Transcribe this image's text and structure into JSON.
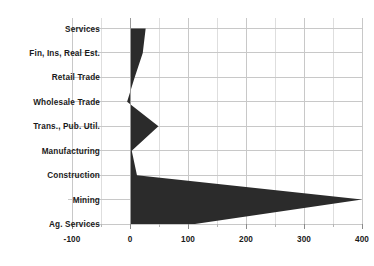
{
  "chart_data": {
    "type": "bar",
    "orientation": "horizontal",
    "title": "",
    "subtitle": "",
    "xlabel": "",
    "ylabel": "",
    "categories": [
      "Services",
      "Fin, Ins, Real Est.",
      "Retail Trade",
      "Wholesale Trade",
      "Trans., Pub. Util.",
      "Manufacturing",
      "Construction",
      "Mining",
      "Ag. Services"
    ],
    "values": [
      27,
      22,
      8,
      -5,
      49,
      3,
      12,
      400,
      112
    ],
    "xlim": [
      -100,
      400
    ],
    "xticks": [
      -100,
      0,
      100,
      200,
      300,
      400
    ],
    "xtick_labels": [
      "-100",
      "0",
      "100",
      "200",
      "300",
      "400"
    ],
    "minor_xticks": [
      -50,
      50,
      150,
      250,
      350
    ],
    "grid": true,
    "legend": false,
    "series": [
      {
        "name": "value",
        "values": [
          27,
          22,
          8,
          -5,
          49,
          3,
          12,
          400,
          112
        ]
      }
    ],
    "colors": {
      "fill": "#2b2b2b",
      "grid": "#c8c8c8",
      "text": "#1a1a1a",
      "background": "#ffffff"
    }
  }
}
